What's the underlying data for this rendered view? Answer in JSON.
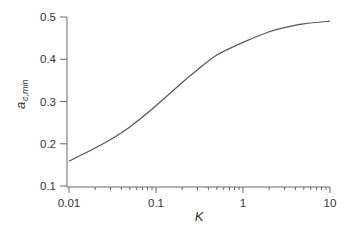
{
  "chart_data": {
    "type": "line",
    "title": "",
    "xlabel": "K",
    "ylabel": "a_c,min",
    "ylabel_main": "a",
    "ylabel_sub": "c,min",
    "xscale": "log",
    "xlim": [
      0.01,
      10
    ],
    "ylim": [
      0.1,
      0.5
    ],
    "grid": false,
    "legend": null,
    "xticks": [
      "0.01",
      "0.1",
      "1",
      "10"
    ],
    "yticks": [
      "0.1",
      "0.2",
      "0.3",
      "0.4",
      "0.5"
    ],
    "series": [
      {
        "name": "a_c,min",
        "color": "#555555",
        "x": [
          0.01,
          0.02,
          0.03,
          0.05,
          0.1,
          0.2,
          0.3,
          0.5,
          1,
          2,
          3,
          5,
          10
        ],
        "y": [
          0.159,
          0.19,
          0.21,
          0.24,
          0.29,
          0.345,
          0.375,
          0.41,
          0.44,
          0.465,
          0.475,
          0.484,
          0.49
        ]
      }
    ]
  }
}
